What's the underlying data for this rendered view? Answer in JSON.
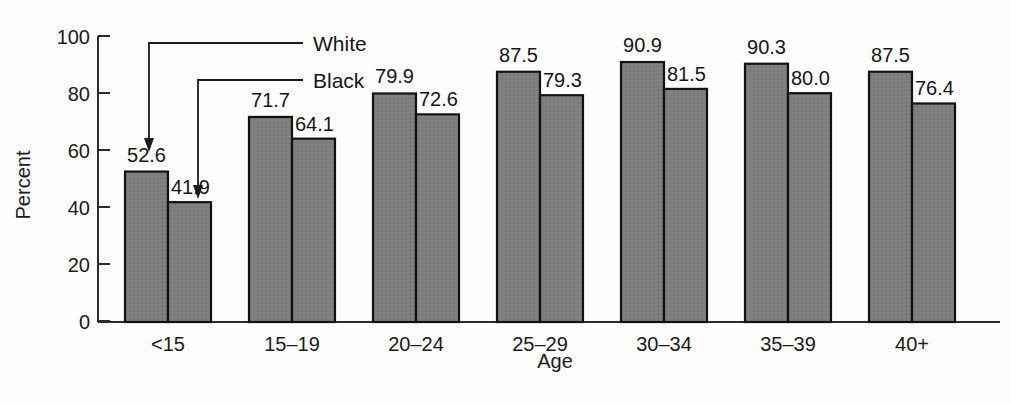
{
  "chart_data": {
    "type": "bar",
    "title": "",
    "xlabel": "Age",
    "ylabel": "Percent",
    "ylim": [
      0,
      100
    ],
    "yticks": [
      0,
      20,
      40,
      60,
      80,
      100
    ],
    "grid": false,
    "legend_position": "inline-annotation-arrows",
    "categories": [
      "<15",
      "15–19",
      "20–24",
      "25–29",
      "30–34",
      "35–39",
      "40+"
    ],
    "series": [
      {
        "name": "White",
        "values": [
          52.6,
          71.7,
          79.9,
          87.5,
          90.9,
          90.3,
          87.5
        ],
        "labels": [
          "52.6",
          "71.7",
          "79.9",
          "87.5",
          "90.9",
          "90.3",
          "87.5"
        ]
      },
      {
        "name": "Black",
        "values": [
          41.9,
          64.1,
          72.6,
          79.3,
          81.5,
          80.0,
          76.4
        ],
        "labels": [
          "41.9",
          "64.1",
          "72.6",
          "79.3",
          "81.5",
          "80.0",
          "76.4"
        ]
      }
    ],
    "annotations": [
      {
        "text": "White",
        "points_to": "first-white-bar"
      },
      {
        "text": "Black",
        "points_to": "first-black-bar"
      }
    ],
    "colors": {
      "bar_fill": "#7d7d7d",
      "bar_edge": "#121212",
      "axis": "#2b2b2b",
      "text": "#151515",
      "background": "#fdfdfd"
    }
  },
  "axis": {
    "y_tick_labels": [
      "100",
      "80",
      "60",
      "40",
      "20",
      "0"
    ],
    "y_title": "Percent",
    "x_title": "Age"
  },
  "legend": {
    "white_label": "White",
    "black_label": "Black"
  }
}
